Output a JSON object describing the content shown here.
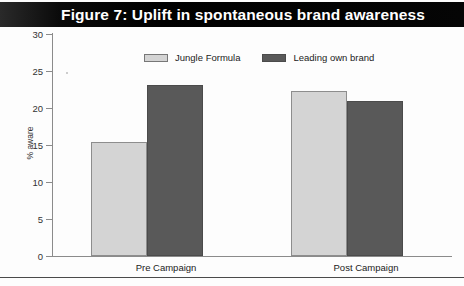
{
  "figure": {
    "title": "Figure 7: Uplift in spontaneous brand awareness",
    "title_bar_color": "#000000",
    "title_text_color": "#ffffff"
  },
  "chart_data": {
    "type": "bar",
    "title": "Figure 7: Uplift in spontaneous brand awareness",
    "categories": [
      "Pre Campaign",
      "Post Campaign"
    ],
    "series": [
      {
        "name": "Jungle Formula",
        "color": "#d4d4d4",
        "values": [
          15.4,
          22.3
        ]
      },
      {
        "name": "Leading own brand",
        "color": "#595959",
        "values": [
          23.1,
          21.0
        ]
      }
    ],
    "xlabel": "",
    "ylabel": "% aware",
    "ylim": [
      0,
      30
    ],
    "ytick_step": 5,
    "yticks": [
      30,
      25,
      20,
      15,
      10,
      5,
      0
    ],
    "ytick_labels": [
      "30",
      "25",
      "20",
      "15",
      "10",
      "5",
      "0"
    ],
    "grid": false,
    "legend_position": "top-center"
  },
  "legend": {
    "items": [
      {
        "label": "Jungle Formula",
        "swatch": "light"
      },
      {
        "label": "Leading own brand",
        "swatch": "dark"
      }
    ]
  },
  "axis": {
    "y_label": "% aware",
    "tick_labels": [
      "30",
      "25",
      "20",
      "15",
      "10",
      "5",
      "0"
    ],
    "category_labels": [
      "Pre Campaign",
      "Post Campaign"
    ]
  }
}
